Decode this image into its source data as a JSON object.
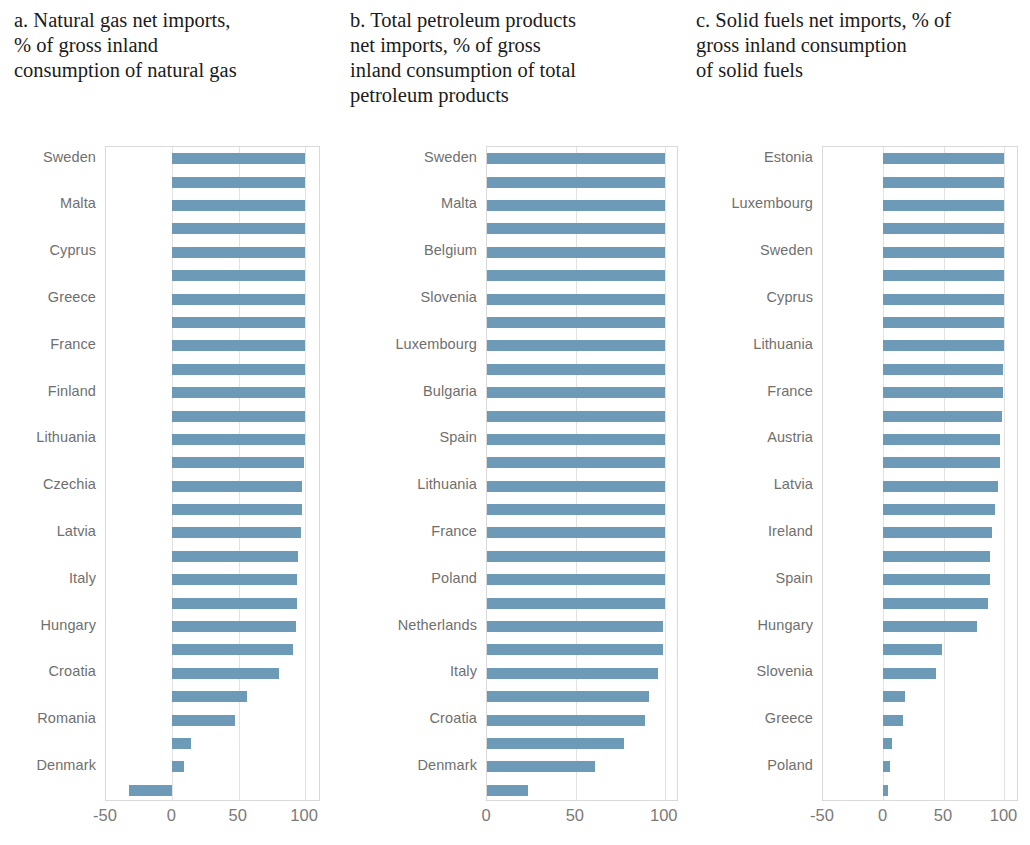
{
  "figure": {
    "background": "#ffffff",
    "bar_color": "#6d9ab6",
    "axis_color": "#d9d9d9",
    "label_color": "#6f6f6f"
  },
  "panels": [
    {
      "id": "panel-a",
      "marker": "a.",
      "title": "a. Natural gas net imports,\n% of gross inland\nconsumption of natural gas"
    },
    {
      "id": "panel-b",
      "marker": "b.",
      "title": "b. Total petroleum products\nnet imports, % of gross\ninland consumption of total\npetroleum products"
    },
    {
      "id": "panel-c",
      "marker": "c.",
      "title": "c. Solid fuels net imports, % of\ngross inland consumption\nof solid fuels"
    }
  ],
  "chart_data": [
    {
      "type": "bar",
      "orientation": "horizontal",
      "title": "a. Natural gas net imports, % of gross inland consumption of natural gas",
      "xlabel": "",
      "ylabel": "",
      "xlim": [
        -50,
        112
      ],
      "xticks": [
        -50,
        0,
        50,
        100
      ],
      "xticklabels": [
        "-50",
        "0",
        "50",
        "100"
      ],
      "grid": true,
      "legend": "none",
      "labeled_every_nth": 2,
      "categories": [
        "Sweden",
        "",
        "Malta",
        "",
        "Cyprus",
        "",
        "Greece",
        "",
        "France",
        "",
        "Finland",
        "",
        "Lithuania",
        "",
        "Czechia",
        "",
        "Latvia",
        "",
        "Italy",
        "",
        "Hungary",
        "",
        "Croatia",
        "",
        "Romania",
        "",
        "Denmark"
      ],
      "values": [
        100,
        100,
        100,
        100,
        100,
        100,
        100,
        100,
        100,
        100,
        100,
        100,
        100,
        99,
        98,
        98,
        97,
        95,
        94,
        94,
        93,
        91,
        80,
        56,
        47,
        14,
        9,
        -33
      ]
    },
    {
      "type": "bar",
      "orientation": "horizontal",
      "title": "b. Total petroleum products net imports, % of gross inland consumption of total petroleum products",
      "xlabel": "",
      "ylabel": "",
      "xlim": [
        0,
        108
      ],
      "xticks": [
        0,
        50,
        100
      ],
      "xticklabels": [
        "0",
        "50",
        "100"
      ],
      "grid": true,
      "legend": "none",
      "labeled_every_nth": 2,
      "categories": [
        "Sweden",
        "",
        "Malta",
        "",
        "Belgium",
        "",
        "Slovenia",
        "",
        "Luxembourg",
        "",
        "Bulgaria",
        "",
        "Spain",
        "",
        "Lithuania",
        "",
        "France",
        "",
        "Poland",
        "",
        "Netherlands",
        "",
        "Italy",
        "",
        "Croatia",
        "",
        "Denmark"
      ],
      "values": [
        100,
        100,
        100,
        100,
        100,
        100,
        100,
        100,
        100,
        100,
        100,
        100,
        100,
        100,
        100,
        100,
        100,
        100,
        100,
        100,
        99,
        99,
        96,
        91,
        89,
        77,
        61,
        23
      ]
    },
    {
      "type": "bar",
      "orientation": "horizontal",
      "title": "c. Solid fuels net imports, % of gross inland consumption of solid fuels",
      "xlabel": "",
      "ylabel": "",
      "xlim": [
        -50,
        112
      ],
      "xticks": [
        -50,
        0,
        50,
        100
      ],
      "xticklabels": [
        "-50",
        "0",
        "50",
        "100"
      ],
      "grid": true,
      "legend": "none",
      "labeled_every_nth": 2,
      "categories": [
        "Estonia",
        "",
        "Luxembourg",
        "",
        "Sweden",
        "",
        "Cyprus",
        "",
        "Lithuania",
        "",
        "France",
        "",
        "Austria",
        "",
        "Latvia",
        "",
        "Ireland",
        "",
        "Spain",
        "",
        "Hungary",
        "",
        "Slovenia",
        "",
        "Greece",
        "",
        "Poland"
      ],
      "values": [
        100,
        100,
        100,
        100,
        100,
        100,
        100,
        100,
        100,
        99,
        99,
        98,
        96,
        96,
        95,
        92,
        90,
        88,
        88,
        86,
        77,
        48,
        43,
        18,
        16,
        7,
        5,
        4
      ]
    }
  ]
}
